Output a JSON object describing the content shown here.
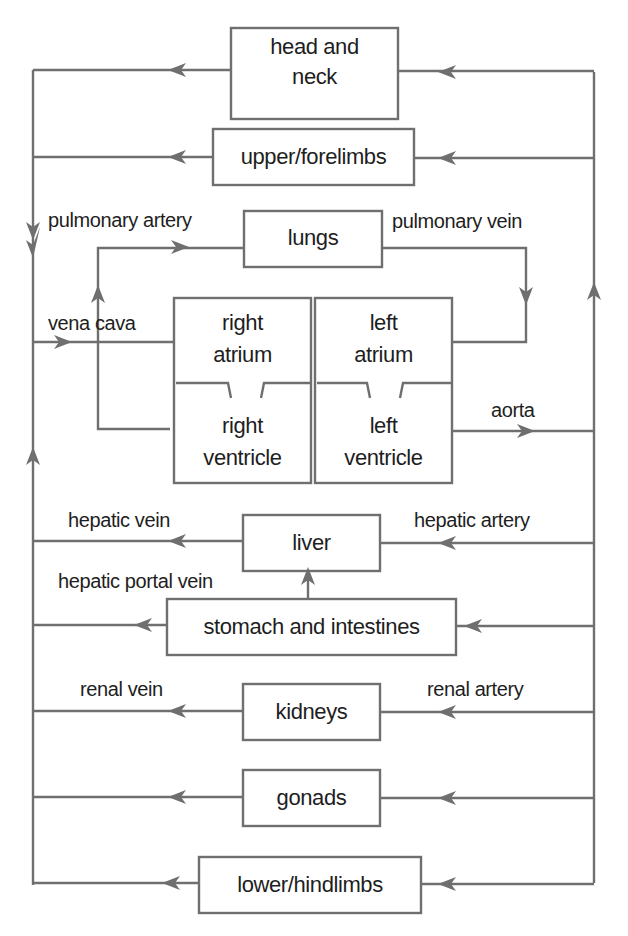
{
  "diagram": {
    "colors": {
      "line": "#6f6f6f",
      "text": "#1e1e1e",
      "background": "#ffffff"
    },
    "nodes": {
      "head_neck": {
        "line1": "head and",
        "line2": "neck"
      },
      "upper_limbs": "upper/forelimbs",
      "lungs": "lungs",
      "right_atrium": {
        "line1": "right",
        "line2": "atrium"
      },
      "left_atrium": {
        "line1": "left",
        "line2": "atrium"
      },
      "right_ventricle": {
        "line1": "right",
        "line2": "ventricle"
      },
      "left_ventricle": {
        "line1": "left",
        "line2": "ventricle"
      },
      "liver": "liver",
      "stomach": "stomach and intestines",
      "kidneys": "kidneys",
      "gonads": "gonads",
      "lower_limbs": "lower/hindlimbs"
    },
    "vessels": {
      "pulmonary_artery": "pulmonary artery",
      "pulmonary_vein": "pulmonary vein",
      "vena_cava": "vena cava",
      "aorta": "aorta",
      "hepatic_vein": "hepatic vein",
      "hepatic_artery": "hepatic artery",
      "hepatic_portal_vein": "hepatic portal vein",
      "renal_vein": "renal vein",
      "renal_artery": "renal artery"
    }
  }
}
